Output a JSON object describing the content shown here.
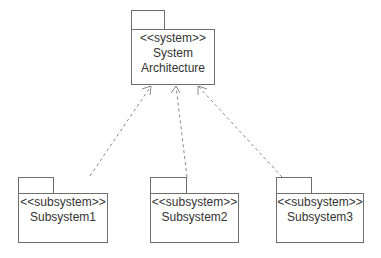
{
  "diagram": {
    "type": "UML package diagram",
    "colors": {
      "line": "#6e6e6e",
      "dashed": "#8a8a8a",
      "text": "#333333",
      "background": "#ffffff"
    },
    "top_package": {
      "stereotype": "<<system>>",
      "name_line1": "System",
      "name_line2": "Architecture"
    },
    "subsystems": [
      {
        "stereotype": "<<subsystem>>",
        "name": "Subsystem1"
      },
      {
        "stereotype": "<<subsystem>>",
        "name": "Subsystem2"
      },
      {
        "stereotype": "<<subsystem>>",
        "name": "Subsystem3"
      }
    ],
    "relations": [
      {
        "from": "Subsystem1",
        "to": "System Architecture",
        "style": "dashed-open-arrow"
      },
      {
        "from": "Subsystem2",
        "to": "System Architecture",
        "style": "dashed-open-arrow"
      },
      {
        "from": "Subsystem3",
        "to": "System Architecture",
        "style": "dashed-open-arrow"
      }
    ]
  }
}
